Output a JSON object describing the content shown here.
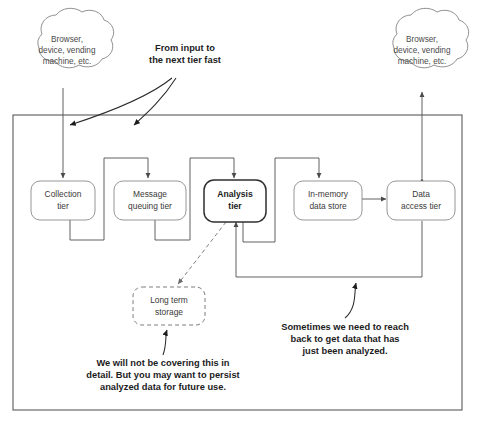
{
  "diagram": {
    "clouds": [
      {
        "id": "left-client-cloud",
        "lines": [
          "Browser,",
          "device, vending",
          "machine, etc."
        ]
      },
      {
        "id": "right-client-cloud",
        "lines": [
          "Browser,",
          "device, vending",
          "machine, etc."
        ]
      }
    ],
    "tiers": [
      {
        "id": "collection-tier",
        "lines": [
          "Collection",
          "tier"
        ],
        "emphasis": false
      },
      {
        "id": "message-queuing-tier",
        "lines": [
          "Message",
          "queuing tier"
        ],
        "emphasis": false
      },
      {
        "id": "analysis-tier",
        "lines": [
          "Analysis",
          "tier"
        ],
        "emphasis": true
      },
      {
        "id": "in-memory-data-store",
        "lines": [
          "In-memory",
          "data store"
        ],
        "emphasis": false
      },
      {
        "id": "data-access-tier",
        "lines": [
          "Data",
          "access tier"
        ],
        "emphasis": false
      }
    ],
    "optional_store": {
      "id": "long-term-storage",
      "lines": [
        "Long term",
        "storage"
      ],
      "style": "dashed"
    },
    "annotations": [
      {
        "id": "input-speed-note",
        "lines": [
          "From input to",
          "the next tier fast"
        ]
      },
      {
        "id": "long-term-storage-note",
        "lines": [
          "We will not be covering this in",
          "detail. But you may want to persist",
          "analyzed data for future use."
        ]
      },
      {
        "id": "reach-back-note",
        "lines": [
          "Sometimes we need to reach",
          "back to get data that has",
          "just been analyzed."
        ]
      }
    ],
    "colors": {
      "background": "#ffffff",
      "node_stroke": "#8a8a8a",
      "emphasis_stroke": "#2f2f2f",
      "frame_stroke": "#5a5a5a",
      "label": "#3a3a3a",
      "annotation": "#1c1c1c"
    }
  }
}
